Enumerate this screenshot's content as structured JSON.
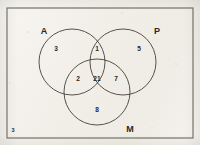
{
  "figure": {
    "kind": "three-set-venn-diagram",
    "background_color": "#f2efe9",
    "ink_color": "#2b2824",
    "border_color": "#6e6a62"
  },
  "universe": {
    "label": "",
    "outside_count": "3",
    "rect": {
      "x": 7,
      "y": 8,
      "width": 186,
      "height": 130
    }
  },
  "sets": [
    {
      "id": "A",
      "label": "A",
      "label_x": 44,
      "label_y": 32,
      "cx": 72,
      "cy": 62,
      "r": 33
    },
    {
      "id": "P",
      "label": "P",
      "label_x": 157,
      "label_y": 32,
      "cx": 123,
      "cy": 62,
      "r": 33
    },
    {
      "id": "M",
      "label": "M",
      "label_x": 130,
      "label_y": 130,
      "cx": 97,
      "cy": 92,
      "r": 33
    }
  ],
  "regions": [
    {
      "id": "A-only",
      "value": "3",
      "x": 56,
      "y": 49
    },
    {
      "id": "A-and-P",
      "value": "1",
      "x": 97,
      "y": 49
    },
    {
      "id": "P-only",
      "value": "5",
      "x": 139,
      "y": 49
    },
    {
      "id": "A-and-M",
      "value": "2",
      "x": 78,
      "y": 79
    },
    {
      "id": "A-P-M",
      "value": "21",
      "x": 97,
      "y": 79
    },
    {
      "id": "P-and-M",
      "value": "7",
      "x": 116,
      "y": 79
    },
    {
      "id": "M-only",
      "value": "8",
      "x": 97,
      "y": 110
    }
  ],
  "universe_count_position": {
    "x": 13,
    "y": 131
  }
}
